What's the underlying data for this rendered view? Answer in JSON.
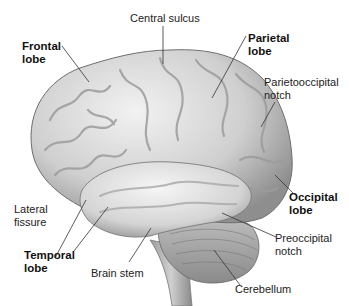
{
  "figure": {
    "labels": [
      {
        "id": "central-sulcus",
        "text": "Central sulcus",
        "bold": false,
        "x": 130,
        "y": 12
      },
      {
        "id": "frontal-lobe",
        "text": "Frontal\nlobe",
        "bold": true,
        "x": 22,
        "y": 40
      },
      {
        "id": "parietal-lobe",
        "text": "Parietal\nlobe",
        "bold": true,
        "x": 248,
        "y": 32
      },
      {
        "id": "parietooccipital-notch",
        "text": "Parietooccipital\nnotch",
        "bold": false,
        "x": 264,
        "y": 76
      },
      {
        "id": "lateral-fissure",
        "text": "Lateral\nfissure",
        "bold": false,
        "x": 14,
        "y": 258
      },
      {
        "id": "occipital-lobe",
        "text": "Occipital\nlobe",
        "bold": true,
        "x": 289,
        "y": 191
      },
      {
        "id": "preoccipital-notch",
        "text": "Preoccipital\nnotch",
        "bold": false,
        "x": 275,
        "y": 232
      },
      {
        "id": "temporal-lobe",
        "text": "Temporal\nlobe",
        "bold": true,
        "x": 24,
        "y": 249
      },
      {
        "id": "brain-stem",
        "text": "Brain stem",
        "bold": false,
        "x": 91,
        "y": 267
      },
      {
        "id": "cerebellum",
        "text": "Cerebellum",
        "bold": false,
        "x": 235,
        "y": 283
      }
    ],
    "colors": {
      "brain_light": "#e4e4e4",
      "brain_mid": "#c2c2c2",
      "brain_dark": "#8a8a8a",
      "leader_line": "#333333",
      "text": "#222222"
    }
  }
}
